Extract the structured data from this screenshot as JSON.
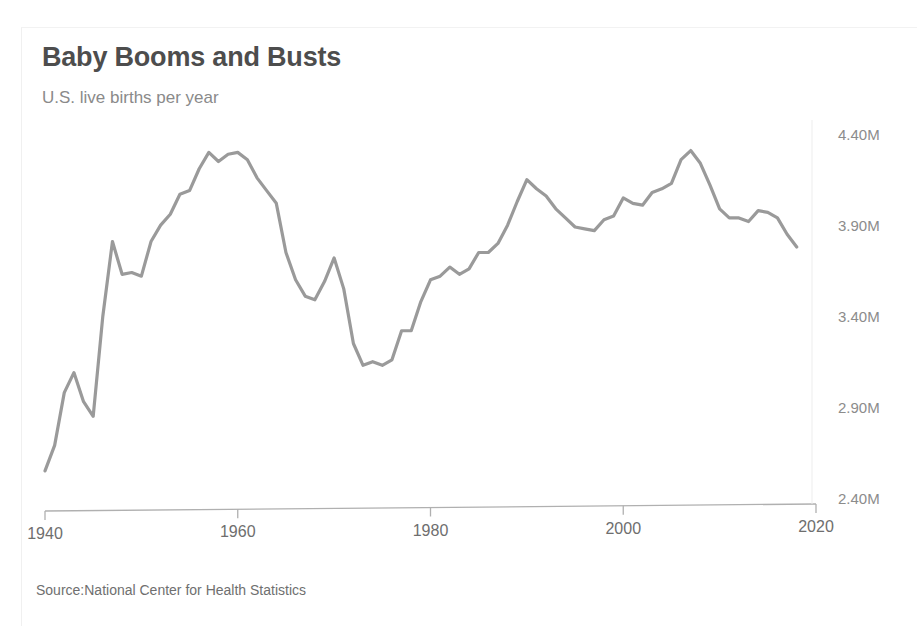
{
  "chart_data": {
    "type": "line",
    "title": "Baby Booms and Busts",
    "subtitle": "U.S. live births per year",
    "source": "Source:National Center for Health Statistics",
    "xlabel": "",
    "ylabel": "",
    "xlim": [
      1940,
      2020
    ],
    "ylim": [
      2.4,
      4.45
    ],
    "grid": false,
    "legend": "none",
    "y_unit": "M",
    "line_color": "#9a9a9a",
    "axis_color": "#b0b0b0",
    "title_color": "#4d4d4d",
    "subtitle_color": "#8a8a8a",
    "x_ticks": [
      1940,
      1960,
      1980,
      2000,
      2020
    ],
    "x_tick_labels": [
      "1940",
      "1960",
      "1980",
      "2000",
      "2020"
    ],
    "y_ticks": [
      2.4,
      2.9,
      3.4,
      3.9,
      4.4
    ],
    "y_tick_labels": [
      "2.40M",
      "2.90M",
      "3.40M",
      "3.90M",
      "4.40M"
    ],
    "x": [
      1940,
      1941,
      1942,
      1943,
      1944,
      1945,
      1946,
      1947,
      1948,
      1949,
      1950,
      1951,
      1952,
      1953,
      1954,
      1955,
      1956,
      1957,
      1958,
      1959,
      1960,
      1961,
      1962,
      1963,
      1964,
      1965,
      1966,
      1967,
      1968,
      1969,
      1970,
      1971,
      1972,
      1973,
      1974,
      1975,
      1976,
      1977,
      1978,
      1979,
      1980,
      1981,
      1982,
      1983,
      1984,
      1985,
      1986,
      1987,
      1988,
      1989,
      1990,
      1991,
      1992,
      1993,
      1994,
      1995,
      1996,
      1997,
      1998,
      1999,
      2000,
      2001,
      2002,
      2003,
      2004,
      2005,
      2006,
      2007,
      2008,
      2009,
      2010,
      2011,
      2012,
      2013,
      2014,
      2015,
      2016,
      2017,
      2018
    ],
    "values": [
      2.56,
      2.7,
      2.99,
      3.1,
      2.94,
      2.86,
      3.41,
      3.82,
      3.64,
      3.65,
      3.63,
      3.82,
      3.91,
      3.97,
      4.08,
      4.1,
      4.22,
      4.31,
      4.26,
      4.3,
      4.31,
      4.27,
      4.17,
      4.1,
      4.03,
      3.76,
      3.61,
      3.52,
      3.5,
      3.6,
      3.73,
      3.56,
      3.26,
      3.14,
      3.16,
      3.14,
      3.17,
      3.33,
      3.33,
      3.49,
      3.61,
      3.63,
      3.68,
      3.64,
      3.67,
      3.76,
      3.76,
      3.81,
      3.91,
      4.04,
      4.16,
      4.11,
      4.07,
      4.0,
      3.95,
      3.9,
      3.89,
      3.88,
      3.94,
      3.96,
      4.06,
      4.03,
      4.02,
      4.09,
      4.11,
      4.14,
      4.27,
      4.32,
      4.25,
      4.13,
      4.0,
      3.95,
      3.95,
      3.93,
      3.99,
      3.98,
      3.95,
      3.86,
      3.79
    ]
  },
  "axes": {
    "x_axis_name": "year-axis",
    "y_axis_name": "births-axis"
  }
}
